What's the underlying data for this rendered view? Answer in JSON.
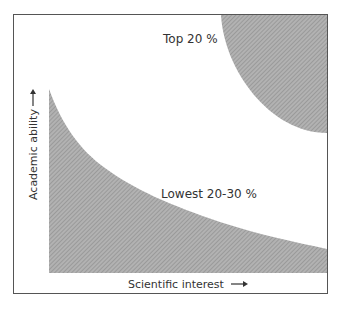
{
  "figure": {
    "regions": [
      {
        "name": "top",
        "label": "Top 20 %"
      },
      {
        "name": "lowest",
        "label": "Lowest 20-30 %"
      }
    ],
    "axes": {
      "x_label": "Scientific interest",
      "y_label": "Academic ability",
      "arrow": "→"
    },
    "colors": {
      "frame": "#555555",
      "shade": "#a9a9a9",
      "hatch": "#8c8c8c",
      "text": "#333333"
    }
  }
}
